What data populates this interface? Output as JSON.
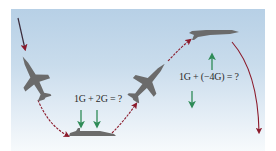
{
  "diagram": {
    "type": "aircraft-maneuver-g-force",
    "equations": {
      "pullout": "1G + 2G = ?",
      "pushover": "1G + (−4G) = ?"
    },
    "colors": {
      "sky_top": "#b7d0e6",
      "sky_bottom": "#f7fafc",
      "path_arrow": "#8b1a2b",
      "force_arrow": "#2e8b57",
      "aircraft": "#6b6b6b"
    },
    "elements": [
      {
        "name": "diving-aircraft",
        "orientation": "nose-down"
      },
      {
        "name": "level-aircraft-bottom",
        "orientation": "level"
      },
      {
        "name": "climbing-aircraft",
        "orientation": "nose-up"
      },
      {
        "name": "level-aircraft-top",
        "orientation": "level"
      }
    ],
    "force_arrows": {
      "pullout": [
        "down",
        "down"
      ],
      "pushover": [
        "up",
        "down"
      ]
    }
  }
}
